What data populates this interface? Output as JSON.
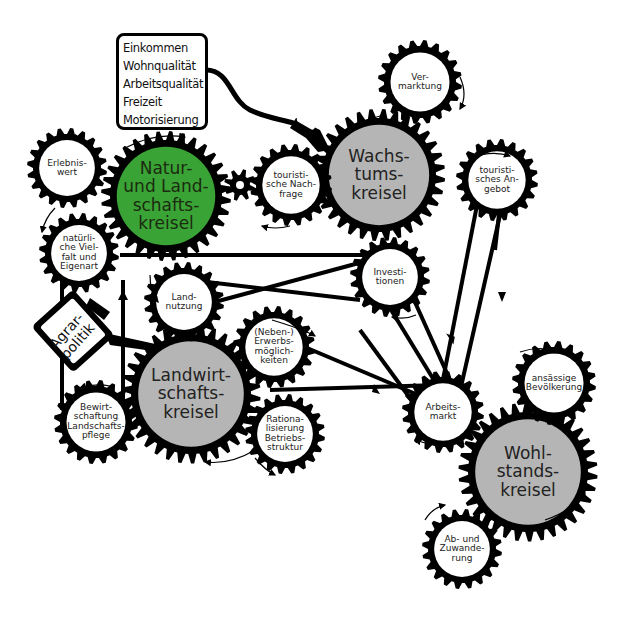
{
  "info_box": {
    "items": [
      "Einkommen",
      "Wohnqualität",
      "Arbeitsqualität",
      "Freizeit",
      "Motorisierung"
    ]
  },
  "agrarpolitik": {
    "label": "Agrar-\npolitik"
  },
  "main_gears": {
    "natur": {
      "label": "Natur-\nund Land-\nschafts-\nkreisel",
      "color": "#3aa335"
    },
    "wachstum": {
      "label": "Wachs-\ntums-\nkreisel",
      "color": "#b5b5b5"
    },
    "landwirtschaft": {
      "label": "Landwirt-\nschafts-\nkreisel",
      "color": "#b5b5b5"
    },
    "wohlstand": {
      "label": "Wohl-\nstands-\nkreisel",
      "color": "#b5b5b5"
    }
  },
  "small_gears": {
    "erlebniswert": "Erlebnis-\nwert",
    "vielfalt": "natürli-\nche Viel-\nfalt und\nEigenart",
    "landnutzung": "Land-\nnutzung",
    "nachfrage": "touristi-\nsche Nach-\nfrage",
    "vermarktung": "Ver-\nmarktung",
    "angebot": "touristi-\nsches An-\ngebot",
    "investitionen": "Investi-\ntionen",
    "erwerb": "(Neben-)\nErwerbs-\nmöglich-\nkeiten",
    "bewirtschaftung": "Bewirt-\nschaftung\nLandschafts-\npflege",
    "rationalisierung": "Rationa-\nlisierung\nBetriebs-\nstruktur",
    "arbeitsmarkt": "Arbeits-\nmarkt",
    "bevoelkerung": "ansässige\nBevölkerung",
    "wanderung": "Ab- und\nZuwande-\nrung"
  },
  "colors": {
    "gear": "#000000",
    "green": "#3aa335",
    "grey": "#b5b5b5",
    "inner": "#ffffff"
  }
}
